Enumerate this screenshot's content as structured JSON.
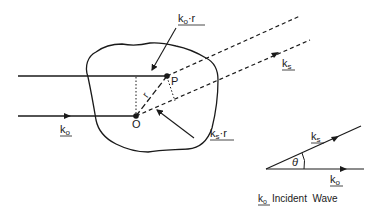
{
  "diagram": {
    "labels": {
      "ko_dot_r": {
        "k": "k",
        "sub": "o",
        "rest": "·r"
      },
      "ks_main": {
        "k": "k",
        "sub": "s"
      },
      "ks_dot_r": {
        "k": "k",
        "sub": "s",
        "rest": "·r"
      },
      "ko_main": {
        "k": "k",
        "sub": "o"
      },
      "point_P": "P",
      "point_O": "O",
      "vector_r": "r",
      "theta": "θ",
      "inset_ks": {
        "k": "k",
        "sub": "s"
      },
      "inset_ko": {
        "k": "k",
        "sub": "o"
      },
      "caption": {
        "k": "k",
        "sub": "o",
        "text": "Incident  Wave"
      }
    },
    "colors": {
      "ink": "#1a1a1a",
      "background": "#ffffff"
    }
  }
}
